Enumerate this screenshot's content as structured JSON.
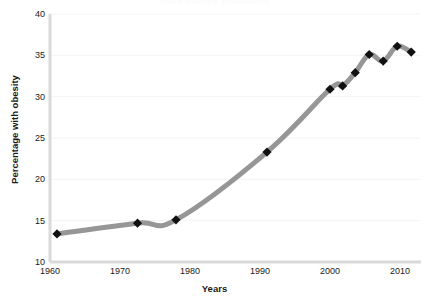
{
  "chart_data": {
    "type": "line",
    "title": "Adult obesity prevalence",
    "xlabel": "Years",
    "ylabel": "Percentage with obesity",
    "xlim": [
      1960,
      2013
    ],
    "ylim": [
      10,
      40
    ],
    "xticks": [
      1960,
      1970,
      1980,
      1990,
      2000,
      2010
    ],
    "xtick_labels": [
      "1960",
      "1970",
      "1980",
      "1990",
      "2000",
      "2010"
    ],
    "yticks": [
      10,
      15,
      20,
      25,
      30,
      35,
      40
    ],
    "ytick_labels": [
      "10",
      "15",
      "20",
      "25",
      "30",
      "35",
      "40"
    ],
    "grid": "horizontal-faint",
    "legend": "none",
    "marker": "diamond",
    "marker_color": "#111111",
    "line_color": "#969696",
    "line_width": 5,
    "series": [
      {
        "name": "Percentage with obesity",
        "x": [
          1961,
          1972.5,
          1978,
          1991,
          2000,
          2001.8,
          2003.6,
          2005.6,
          2007.6,
          2009.6,
          2011.6
        ],
        "values": [
          13.4,
          14.7,
          15.1,
          23.3,
          30.9,
          31.3,
          32.9,
          35.1,
          34.3,
          36.1,
          35.4
        ]
      }
    ]
  },
  "axis": {
    "y_axis_color": "#d9d9d9",
    "x_axis_color": "#d9d9d9"
  }
}
